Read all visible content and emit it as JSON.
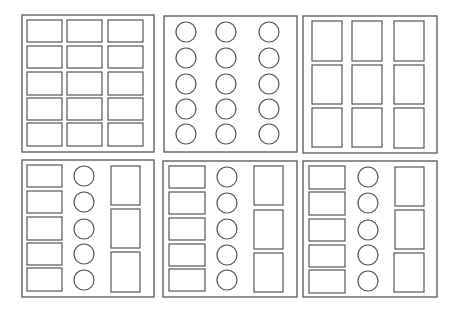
{
  "diagram": {
    "title": "",
    "stroke_color": "#555555",
    "background": "#ffffff",
    "panels": [
      {
        "id": "panel-1",
        "position": "top-left",
        "frame": {
          "x": 22,
          "y": 15,
          "w": 132,
          "h": 137
        },
        "layout": "grid of wide rectangles, 3 columns x 5 rows",
        "rects": [
          {
            "x": 27,
            "y": 20,
            "w": 35,
            "h": 22
          },
          {
            "x": 67,
            "y": 20,
            "w": 35,
            "h": 22
          },
          {
            "x": 108,
            "y": 20,
            "w": 35,
            "h": 22
          },
          {
            "x": 27,
            "y": 46,
            "w": 35,
            "h": 22
          },
          {
            "x": 67,
            "y": 46,
            "w": 35,
            "h": 22
          },
          {
            "x": 108,
            "y": 46,
            "w": 35,
            "h": 22
          },
          {
            "x": 27,
            "y": 72,
            "w": 35,
            "h": 23
          },
          {
            "x": 67,
            "y": 72,
            "w": 35,
            "h": 23
          },
          {
            "x": 108,
            "y": 72,
            "w": 35,
            "h": 23
          },
          {
            "x": 27,
            "y": 98,
            "w": 35,
            "h": 22
          },
          {
            "x": 67,
            "y": 98,
            "w": 35,
            "h": 22
          },
          {
            "x": 108,
            "y": 98,
            "w": 35,
            "h": 22
          },
          {
            "x": 27,
            "y": 123,
            "w": 35,
            "h": 23
          },
          {
            "x": 67,
            "y": 123,
            "w": 35,
            "h": 23
          },
          {
            "x": 108,
            "y": 123,
            "w": 35,
            "h": 23
          }
        ],
        "circles": []
      },
      {
        "id": "panel-2",
        "position": "top-center",
        "frame": {
          "x": 164,
          "y": 16,
          "w": 133,
          "h": 136
        },
        "layout": "grid of circles, 3 columns x 5 rows",
        "rects": [],
        "circles": [
          {
            "cx": 186,
            "cy": 32,
            "r": 10
          },
          {
            "cx": 226,
            "cy": 32,
            "r": 10
          },
          {
            "cx": 269,
            "cy": 32,
            "r": 10
          },
          {
            "cx": 186,
            "cy": 58,
            "r": 10
          },
          {
            "cx": 226,
            "cy": 58,
            "r": 10
          },
          {
            "cx": 269,
            "cy": 58,
            "r": 10
          },
          {
            "cx": 186,
            "cy": 84,
            "r": 10
          },
          {
            "cx": 226,
            "cy": 84,
            "r": 10
          },
          {
            "cx": 269,
            "cy": 84,
            "r": 10
          },
          {
            "cx": 186,
            "cy": 109,
            "r": 10
          },
          {
            "cx": 226,
            "cy": 109,
            "r": 10
          },
          {
            "cx": 269,
            "cy": 109,
            "r": 10
          },
          {
            "cx": 186,
            "cy": 134,
            "r": 10
          },
          {
            "cx": 226,
            "cy": 134,
            "r": 10
          },
          {
            "cx": 269,
            "cy": 134,
            "r": 10
          }
        ]
      },
      {
        "id": "panel-3",
        "position": "top-right",
        "frame": {
          "x": 303,
          "y": 16,
          "w": 134,
          "h": 137
        },
        "layout": "grid of tall rectangles, 3 columns x 3 rows",
        "rects": [
          {
            "x": 312,
            "y": 21,
            "w": 30,
            "h": 40
          },
          {
            "x": 352,
            "y": 21,
            "w": 30,
            "h": 40
          },
          {
            "x": 394,
            "y": 21,
            "w": 30,
            "h": 40
          },
          {
            "x": 312,
            "y": 65,
            "w": 30,
            "h": 39
          },
          {
            "x": 352,
            "y": 65,
            "w": 30,
            "h": 39
          },
          {
            "x": 394,
            "y": 65,
            "w": 30,
            "h": 39
          },
          {
            "x": 312,
            "y": 108,
            "w": 30,
            "h": 39
          },
          {
            "x": 352,
            "y": 108,
            "w": 30,
            "h": 39
          },
          {
            "x": 394,
            "y": 108,
            "w": 30,
            "h": 40
          }
        ],
        "circles": []
      },
      {
        "id": "panel-4",
        "position": "bottom-left",
        "frame": {
          "x": 22,
          "y": 160,
          "w": 132,
          "h": 137
        },
        "layout": "mixed: column of 5 wide rects, column of 5 circles, column of 3 tall rects",
        "rects": [
          {
            "x": 27,
            "y": 165,
            "w": 35,
            "h": 22
          },
          {
            "x": 27,
            "y": 191,
            "w": 35,
            "h": 22
          },
          {
            "x": 27,
            "y": 217,
            "w": 35,
            "h": 23
          },
          {
            "x": 27,
            "y": 243,
            "w": 35,
            "h": 22
          },
          {
            "x": 27,
            "y": 268,
            "w": 35,
            "h": 23
          },
          {
            "x": 111,
            "y": 166,
            "w": 29,
            "h": 39
          },
          {
            "x": 111,
            "y": 209,
            "w": 29,
            "h": 39
          },
          {
            "x": 111,
            "y": 252,
            "w": 29,
            "h": 40
          }
        ],
        "circles": [
          {
            "cx": 84,
            "cy": 176,
            "r": 10
          },
          {
            "cx": 84,
            "cy": 202,
            "r": 10
          },
          {
            "cx": 84,
            "cy": 229,
            "r": 10
          },
          {
            "cx": 84,
            "cy": 254,
            "r": 10
          },
          {
            "cx": 84,
            "cy": 280,
            "r": 10
          }
        ]
      },
      {
        "id": "panel-5",
        "position": "bottom-center",
        "frame": {
          "x": 163,
          "y": 161,
          "w": 134,
          "h": 136
        },
        "layout": "mixed: column of 5 wide rects, column of 5 circles, column of 3 tall rects",
        "rects": [
          {
            "x": 169,
            "y": 166,
            "w": 36,
            "h": 22
          },
          {
            "x": 169,
            "y": 192,
            "w": 36,
            "h": 22
          },
          {
            "x": 169,
            "y": 218,
            "w": 36,
            "h": 22
          },
          {
            "x": 169,
            "y": 244,
            "w": 36,
            "h": 22
          },
          {
            "x": 169,
            "y": 269,
            "w": 36,
            "h": 22
          },
          {
            "x": 254,
            "y": 166,
            "w": 29,
            "h": 39
          },
          {
            "x": 254,
            "y": 210,
            "w": 29,
            "h": 39
          },
          {
            "x": 254,
            "y": 253,
            "w": 29,
            "h": 39
          }
        ],
        "circles": [
          {
            "cx": 227,
            "cy": 177,
            "r": 10
          },
          {
            "cx": 227,
            "cy": 203,
            "r": 10
          },
          {
            "cx": 227,
            "cy": 229,
            "r": 10
          },
          {
            "cx": 227,
            "cy": 255,
            "r": 10
          },
          {
            "cx": 227,
            "cy": 280,
            "r": 10
          }
        ]
      },
      {
        "id": "panel-6",
        "position": "bottom-right",
        "frame": {
          "x": 303,
          "y": 161,
          "w": 134,
          "h": 136
        },
        "layout": "mixed: column of 5 wide rects, column of 5 circles, column of 3 tall rects",
        "rects": [
          {
            "x": 309,
            "y": 166,
            "w": 36,
            "h": 23
          },
          {
            "x": 309,
            "y": 192,
            "w": 36,
            "h": 23
          },
          {
            "x": 309,
            "y": 219,
            "w": 36,
            "h": 22
          },
          {
            "x": 309,
            "y": 245,
            "w": 36,
            "h": 22
          },
          {
            "x": 309,
            "y": 270,
            "w": 36,
            "h": 23
          },
          {
            "x": 395,
            "y": 167,
            "w": 29,
            "h": 39
          },
          {
            "x": 395,
            "y": 210,
            "w": 29,
            "h": 39
          },
          {
            "x": 394,
            "y": 253,
            "w": 30,
            "h": 39
          }
        ],
        "circles": [
          {
            "cx": 368,
            "cy": 177,
            "r": 10
          },
          {
            "cx": 368,
            "cy": 203,
            "r": 10
          },
          {
            "cx": 368,
            "cy": 230,
            "r": 10
          },
          {
            "cx": 368,
            "cy": 255,
            "r": 10
          },
          {
            "cx": 368,
            "cy": 281,
            "r": 10
          }
        ]
      }
    ]
  }
}
